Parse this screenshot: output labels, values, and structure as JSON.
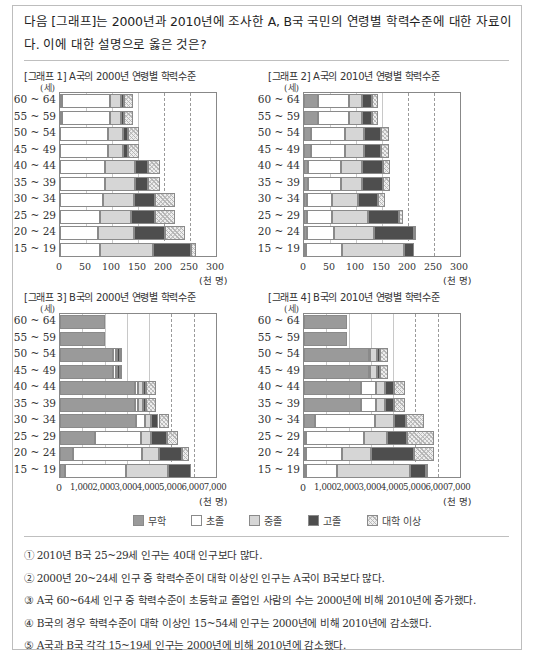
{
  "question": {
    "text": "다음 [그래프]는 2000년과 2010년에 조사한 A, B국 국민의 연령별 학력수준에 대한 자료이다. 이에 대한 설명으로 옳은 것은?"
  },
  "legend": [
    {
      "key": "none",
      "label": "무학",
      "color": "#9a9a9a"
    },
    {
      "key": "elementary",
      "label": "초졸",
      "color": "#ffffff"
    },
    {
      "key": "middle",
      "label": "중졸",
      "color": "#d6d6d6"
    },
    {
      "key": "high",
      "label": "고졸",
      "color": "#4e4e4e"
    },
    {
      "key": "college",
      "label": "대학 이상",
      "color": "hatched"
    }
  ],
  "options": [
    "① 2010년 B국 25~29세 인구는 40대 인구보다 많다.",
    "② 2000년 20~24세 인구 중 학력수준이 대학 이상인 인구는 A국이 B국보다 많다.",
    "③ A국 60~64세 인구 중 학력수준이 초등학교 졸업인 사람의 수는 2000년에 비해 2010년에 증가했다.",
    "④ B국의 경우 학력수준이 대학 이상인 15~54세 인구는 2000년에 비해 2010년에 감소했다.",
    "⑤ A국과 B국 각각 15~19세 인구는 2000년에 비해 2010년에 감소했다."
  ],
  "chart_data": [
    {
      "type": "bar",
      "orientation": "horizontal",
      "stacked": true,
      "title": "[그래프 1] A국의 2000년 연령별 학력수준",
      "ylabel": "(세)",
      "xlabel": "(천 명)",
      "xlim": [
        0,
        300
      ],
      "xticks": [
        "0",
        "50",
        "100",
        "150",
        "200",
        "250",
        "300"
      ],
      "grid": "vertical dashed",
      "categories": [
        "60~64",
        "55~59",
        "50~54",
        "45~49",
        "40~44",
        "35~39",
        "30~34",
        "25~29",
        "20~24",
        "15~19"
      ],
      "series": [
        {
          "name": "무학",
          "values": [
            3,
            3,
            0,
            0,
            0,
            0,
            0,
            0,
            0,
            0
          ]
        },
        {
          "name": "초졸",
          "values": [
            94,
            94,
            92,
            92,
            87,
            87,
            82,
            76,
            73,
            77
          ]
        },
        {
          "name": "중졸",
          "values": [
            20,
            20,
            29,
            29,
            57,
            57,
            61,
            61,
            70,
            101
          ]
        },
        {
          "name": "고졸",
          "values": [
            7,
            7,
            9,
            9,
            25,
            25,
            39,
            45,
            59,
            73
          ]
        },
        {
          "name": "대학 이상",
          "values": [
            16,
            16,
            22,
            22,
            24,
            24,
            39,
            39,
            39,
            10
          ]
        }
      ]
    },
    {
      "type": "bar",
      "orientation": "horizontal",
      "stacked": true,
      "title": "[그래프 2] A국의 2010년 연령별 학력수준",
      "ylabel": "(세)",
      "xlabel": "(천 명)",
      "xlim": [
        0,
        300
      ],
      "xticks": [
        "0",
        "50",
        "100",
        "150",
        "200",
        "250",
        "300"
      ],
      "grid": "vertical dashed",
      "categories": [
        "60~64",
        "55~59",
        "50~54",
        "45~49",
        "40~44",
        "35~39",
        "30~34",
        "25~29",
        "20~24",
        "15~19"
      ],
      "series": [
        {
          "name": "무학",
          "values": [
            27,
            27,
            14,
            14,
            8,
            8,
            5,
            5,
            5,
            4
          ]
        },
        {
          "name": "초졸",
          "values": [
            60,
            60,
            65,
            65,
            64,
            64,
            48,
            48,
            52,
            69
          ]
        },
        {
          "name": "중졸",
          "values": [
            24,
            24,
            36,
            36,
            40,
            40,
            51,
            70,
            78,
            120
          ]
        },
        {
          "name": "고졸",
          "values": [
            19,
            19,
            34,
            34,
            40,
            40,
            39,
            59,
            76,
            19
          ]
        },
        {
          "name": "대학 이상",
          "values": [
            12,
            12,
            15,
            15,
            14,
            14,
            13,
            9,
            4,
            0
          ]
        }
      ]
    },
    {
      "type": "bar",
      "orientation": "horizontal",
      "stacked": true,
      "title": "[그래프 3] B국의 2000년 연령별 학력수준",
      "ylabel": "(세)",
      "xlabel": "(천 명)",
      "xlim": [
        0,
        7000
      ],
      "xticks": [
        "0",
        "1,000",
        "2,000",
        "3,000",
        "4,000",
        "5,000",
        "6,000",
        "7,000"
      ],
      "grid": "vertical dashed",
      "categories": [
        "60~64",
        "55~59",
        "50~54",
        "45~49",
        "40~44",
        "35~39",
        "30~34",
        "25~29",
        "20~24",
        "15~19"
      ],
      "series": [
        {
          "name": "무학",
          "values": [
            2000,
            2000,
            2400,
            2400,
            3370,
            3370,
            3410,
            1570,
            580,
            240
          ]
        },
        {
          "name": "초졸",
          "values": [
            0,
            0,
            120,
            120,
            150,
            150,
            390,
            2080,
            3120,
            2700
          ]
        },
        {
          "name": "중졸",
          "values": [
            0,
            0,
            40,
            40,
            220,
            220,
            300,
            450,
            760,
            1920
          ]
        },
        {
          "name": "고졸",
          "values": [
            0,
            0,
            120,
            120,
            140,
            140,
            320,
            720,
            1010,
            1010
          ]
        },
        {
          "name": "대학 이상",
          "values": [
            0,
            0,
            80,
            80,
            440,
            440,
            460,
            470,
            310,
            0
          ]
        }
      ]
    },
    {
      "type": "bar",
      "orientation": "horizontal",
      "stacked": true,
      "title": "[그래프 4] B국의 2010년 연령별 학력수준",
      "ylabel": "(세)",
      "xlabel": "(천 명)",
      "xlim": [
        0,
        7000
      ],
      "xticks": [
        "0",
        "1,000",
        "2,000",
        "3,000",
        "4,000",
        "5,000",
        "6,000",
        "7,000"
      ],
      "grid": "vertical dashed",
      "categories": [
        "60~64",
        "55~59",
        "50~54",
        "45~49",
        "40~44",
        "35~39",
        "30~34",
        "25~29",
        "20~24",
        "15~19"
      ],
      "series": [
        {
          "name": "무학",
          "values": [
            1930,
            1930,
            2910,
            2910,
            2550,
            2550,
            480,
            110,
            110,
            90
          ]
        },
        {
          "name": "초졸",
          "values": [
            0,
            0,
            40,
            40,
            700,
            700,
            2700,
            2590,
            1590,
            1380
          ]
        },
        {
          "name": "중졸",
          "values": [
            0,
            0,
            310,
            310,
            400,
            400,
            850,
            1030,
            1290,
            3300
          ]
        },
        {
          "name": "고졸",
          "values": [
            0,
            0,
            140,
            140,
            410,
            410,
            550,
            880,
            1930,
            710
          ]
        },
        {
          "name": "대학 이상",
          "values": [
            0,
            0,
            360,
            360,
            490,
            490,
            810,
            1220,
            910,
            50
          ]
        }
      ]
    }
  ]
}
